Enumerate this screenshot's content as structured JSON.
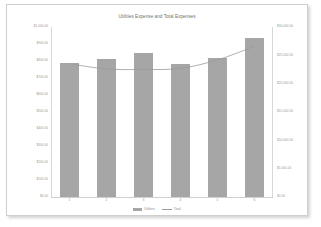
{
  "chart_data": {
    "type": "bar",
    "title": "Utilities Expense and Total Expenses",
    "xlabel": "",
    "ylabel": "",
    "grid": false,
    "legend_position": "bottom",
    "categories": [
      "1",
      "2",
      "3",
      "4",
      "5",
      "6"
    ],
    "series": [
      {
        "name": "Utilities",
        "type": "bar",
        "axis": "left",
        "color": "#a6a6a6",
        "values": [
          790,
          810,
          850,
          780,
          820,
          935
        ]
      },
      {
        "name": "Total",
        "type": "line",
        "axis": "right",
        "color": "#9c9c9c",
        "values": [
          23500,
          22600,
          22500,
          22700,
          24200,
          26600
        ]
      }
    ],
    "left_axis": {
      "ylim": [
        0,
        1000
      ],
      "tick_labels": [
        "$1,000.00",
        "$900.00",
        "$800.00",
        "$700.00",
        "$600.00",
        "$500.00",
        "$400.00",
        "$300.00",
        "$200.00",
        "$100.00",
        "$0.00"
      ],
      "tick_values": [
        1000,
        900,
        800,
        700,
        600,
        500,
        400,
        300,
        200,
        100,
        0
      ]
    },
    "right_axis": {
      "ylim": [
        0,
        30000
      ],
      "tick_labels": [
        "$30,000.00",
        "$25,000.00",
        "$20,000.00",
        "$15,000.00",
        "$10,000.00",
        "$5,000.00",
        "$0.00"
      ],
      "tick_values": [
        30000,
        25000,
        20000,
        15000,
        10000,
        5000,
        0
      ]
    }
  },
  "legend": {
    "items": [
      {
        "label": "Utilities",
        "marker": "bar-swatch"
      },
      {
        "label": "Total",
        "marker": "line-marker"
      }
    ]
  },
  "colors": {
    "bar": "#a6a6a6",
    "line": "#9c9c9c",
    "tick_text": "#9a9a9a",
    "title_text": "#6f6f6f",
    "frame_border": "#cfcfcf",
    "page_background": "#ffffff"
  }
}
